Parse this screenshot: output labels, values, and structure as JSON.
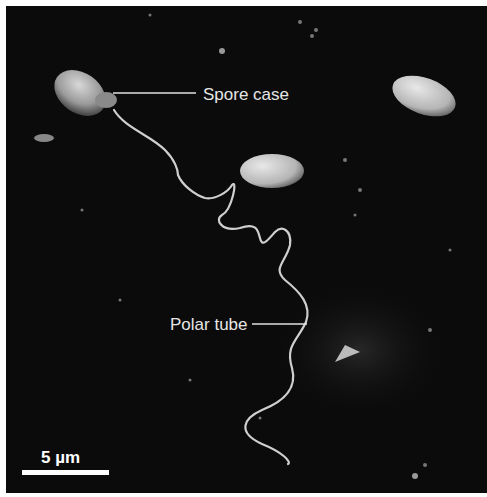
{
  "figure": {
    "background_color": "#0b0b0b",
    "labels": [
      {
        "text": "Spore case",
        "x": 203,
        "y": 88
      },
      {
        "text": "Polar tube",
        "x": 170,
        "y": 317
      }
    ],
    "scale_bar": {
      "label": "5 µm",
      "length_px": 87
    }
  }
}
